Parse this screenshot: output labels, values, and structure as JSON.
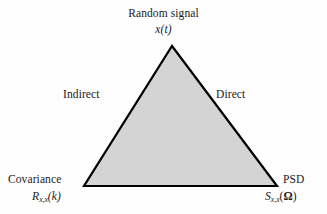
{
  "figure": {
    "background_color": "#fefefe",
    "shape": {
      "name": "triangle",
      "fill_color": "#d4d4d4",
      "stroke_color": "#000000",
      "stroke_width": 2.2,
      "vertices": {
        "apex": [
          172,
          46
        ],
        "bottom_left": [
          84,
          186
        ],
        "bottom_right": [
          277,
          186
        ]
      }
    }
  },
  "labels": {
    "apex": {
      "title": "Random signal",
      "symbol": "x(t)"
    },
    "left_edge": {
      "text": "Indirect"
    },
    "right_edge": {
      "text": "Direct"
    },
    "bottom_left": {
      "title": "Covariance",
      "symbol_base": "R",
      "symbol_sub": "x,x",
      "symbol_arg": "(k)"
    },
    "bottom_right": {
      "title": "PSD",
      "symbol_base": "S",
      "symbol_sub": "x,x",
      "symbol_arg_open": "(",
      "symbol_arg_var": "Ω",
      "symbol_arg_close": ")"
    }
  }
}
